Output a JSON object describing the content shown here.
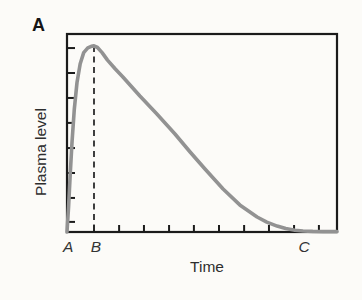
{
  "figure": {
    "panel_label": "A",
    "background": "#fcfbf8"
  },
  "chart_data": {
    "type": "line",
    "title": "",
    "xlabel": "Time",
    "ylabel": "Plasma level",
    "axes": {
      "frame": "full-box",
      "frame_color": "#1b1b1b",
      "numeric_tick_labels": false,
      "x_range_fraction": [
        0,
        1
      ],
      "y_range_fraction": [
        0,
        1
      ],
      "x_tick_fractions": [
        0.1,
        0.193,
        0.285,
        0.378,
        0.47,
        0.563,
        0.656,
        0.748,
        0.841,
        0.933
      ],
      "y_tick_fractions": [
        0.051,
        0.172,
        0.298,
        0.424,
        0.551,
        0.677,
        0.803,
        0.929
      ]
    },
    "x_markers": [
      {
        "label": "A",
        "x": 0.004
      },
      {
        "label": "B",
        "x": 0.107
      },
      {
        "label": "C",
        "x": 0.878
      }
    ],
    "dashed_line": {
      "x": 0.1,
      "from_y": 0.0,
      "to_y": 0.94,
      "style": "dashed",
      "color": "#2b2b2b"
    },
    "series": [
      {
        "name": "plasma-level-curve",
        "color": "#929292",
        "stroke_width": 3.6,
        "points": [
          [
            0.0,
            0.0
          ],
          [
            0.006,
            0.13
          ],
          [
            0.012,
            0.29
          ],
          [
            0.019,
            0.46
          ],
          [
            0.027,
            0.62
          ],
          [
            0.037,
            0.755
          ],
          [
            0.049,
            0.85
          ],
          [
            0.062,
            0.906
          ],
          [
            0.077,
            0.93
          ],
          [
            0.09,
            0.938
          ],
          [
            0.1,
            0.94
          ],
          [
            0.113,
            0.932
          ],
          [
            0.13,
            0.906
          ],
          [
            0.15,
            0.868
          ],
          [
            0.178,
            0.824
          ],
          [
            0.207,
            0.783
          ],
          [
            0.27,
            0.687
          ],
          [
            0.333,
            0.596
          ],
          [
            0.4,
            0.495
          ],
          [
            0.456,
            0.404
          ],
          [
            0.511,
            0.318
          ],
          [
            0.578,
            0.217
          ],
          [
            0.64,
            0.137
          ],
          [
            0.704,
            0.076
          ],
          [
            0.74,
            0.05
          ],
          [
            0.778,
            0.03
          ],
          [
            0.81,
            0.017
          ],
          [
            0.844,
            0.009
          ],
          [
            0.874,
            0.005
          ],
          [
            0.91,
            0.003
          ],
          [
            0.95,
            0.002
          ],
          [
            1.0,
            0.002
          ]
        ]
      }
    ]
  }
}
